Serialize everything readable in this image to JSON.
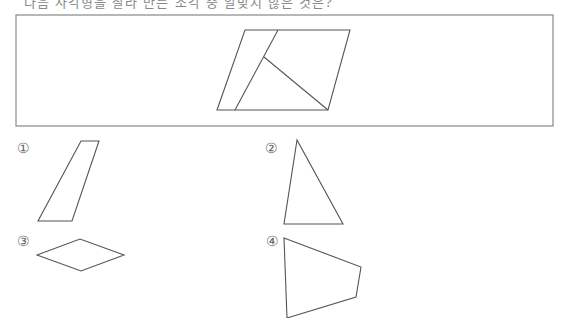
{
  "header": {
    "cropped_text": "다음 사각형을 잘라 만든 조각 중 알맞지 않은 것은?"
  },
  "figure": {
    "frame": {
      "x": 16,
      "y": 15,
      "width": 537,
      "height": 111
    },
    "main_parallelogram": "217,110 245,30 350,30 328,110",
    "cut_line_1": {
      "x1": 278,
      "y1": 30,
      "x2": 235,
      "y2": 110
    },
    "cut_line_2": {
      "x1": 264,
      "y1": 57,
      "x2": 328,
      "y2": 110
    },
    "stroke_color": "#555555"
  },
  "options": [
    {
      "label": "①",
      "shape": "trapezoid",
      "points": "81,141 99,141 72,221 38,221",
      "label_x": 17,
      "label_y": 140
    },
    {
      "label": "②",
      "shape": "triangle",
      "points": "297,140 284,224 343,224",
      "label_x": 265,
      "label_y": 140
    },
    {
      "label": "③",
      "shape": "rhombus",
      "points": "37,255 80,239 124,255 81,271",
      "label_x": 17,
      "label_y": 233
    },
    {
      "label": "④",
      "shape": "quadrilateral",
      "points": "284,238 361,267 356,297 287,318",
      "label_x": 266,
      "label_y": 233
    }
  ]
}
